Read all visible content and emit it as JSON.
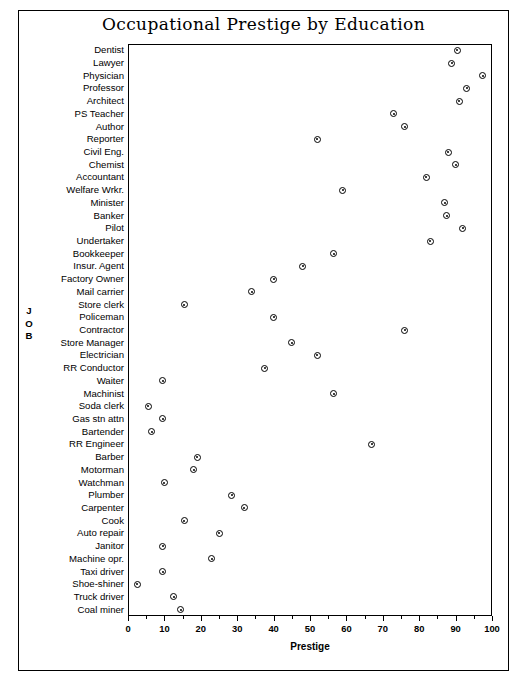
{
  "chart_data": {
    "type": "scatter",
    "title": "Occupational Prestige by Education",
    "xlabel": "Prestige",
    "ylabel": "JOB",
    "xlim": [
      0,
      100
    ],
    "xticks": [
      0,
      10,
      20,
      30,
      40,
      50,
      60,
      70,
      80,
      90,
      100
    ],
    "xticklabels": [
      "0",
      "10",
      "20",
      "30",
      "40",
      "50",
      "60",
      "70",
      "80",
      "90",
      "100"
    ],
    "grid": false,
    "legend": null,
    "marker": "circle-with-center-dot",
    "categories": [
      "Dentist",
      "Lawyer",
      "Physician",
      "Professor",
      "Architect",
      "PS Teacher",
      "Author",
      "Reporter",
      "Civil Eng.",
      "Chemist",
      "Accountant",
      "Welfare Wrkr.",
      "Minister",
      "Banker",
      "Pilot",
      "Undertaker",
      "Bookkeeper",
      "Insur. Agent",
      "Factory Owner",
      "Mail carrier",
      "Store clerk",
      "Policeman",
      "Contractor",
      "Store Manager",
      "Electrician",
      "RR Conductor",
      "Waiter",
      "Machinist",
      "Soda clerk",
      "Gas stn attn",
      "Bartender",
      "RR Engineer",
      "Barber",
      "Motorman",
      "Watchman",
      "Plumber",
      "Carpenter",
      "Cook",
      "Auto repair",
      "Janitor",
      "Machine opr.",
      "Taxi driver",
      "Shoe-shiner",
      "Truck driver",
      "Coal miner"
    ],
    "values": [
      90.5,
      89.0,
      97.5,
      93.0,
      91.0,
      73.0,
      76.0,
      52.0,
      88.0,
      90.0,
      82.0,
      59.0,
      87.0,
      87.5,
      92.0,
      83.0,
      56.5,
      48.0,
      40.0,
      34.0,
      15.5,
      40.0,
      76.0,
      45.0,
      52.0,
      37.5,
      9.5,
      56.5,
      5.5,
      9.5,
      6.5,
      67.0,
      19.0,
      18.0,
      10.0,
      28.5,
      32.0,
      15.5,
      25.0,
      9.5,
      23.0,
      9.5,
      2.5,
      12.5,
      14.5
    ],
    "series": [
      {
        "name": "Prestige",
        "points": [
          {
            "label": "Dentist",
            "value": 90.5
          },
          {
            "label": "Lawyer",
            "value": 89.0
          },
          {
            "label": "Physician",
            "value": 97.5
          },
          {
            "label": "Professor",
            "value": 93.0
          },
          {
            "label": "Architect",
            "value": 91.0
          },
          {
            "label": "PS Teacher",
            "value": 73.0
          },
          {
            "label": "Author",
            "value": 76.0
          },
          {
            "label": "Reporter",
            "value": 52.0
          },
          {
            "label": "Civil Eng.",
            "value": 88.0
          },
          {
            "label": "Chemist",
            "value": 90.0
          },
          {
            "label": "Accountant",
            "value": 82.0
          },
          {
            "label": "Welfare Wrkr.",
            "value": 59.0
          },
          {
            "label": "Minister",
            "value": 87.0
          },
          {
            "label": "Banker",
            "value": 87.5
          },
          {
            "label": "Pilot",
            "value": 92.0
          },
          {
            "label": "Undertaker",
            "value": 83.0
          },
          {
            "label": "Bookkeeper",
            "value": 56.5
          },
          {
            "label": "Insur. Agent",
            "value": 48.0
          },
          {
            "label": "Factory Owner",
            "value": 40.0
          },
          {
            "label": "Mail carrier",
            "value": 34.0
          },
          {
            "label": "Store clerk",
            "value": 15.5
          },
          {
            "label": "Policeman",
            "value": 40.0
          },
          {
            "label": "Contractor",
            "value": 76.0
          },
          {
            "label": "Store Manager",
            "value": 45.0
          },
          {
            "label": "Electrician",
            "value": 52.0
          },
          {
            "label": "RR Conductor",
            "value": 37.5
          },
          {
            "label": "Waiter",
            "value": 9.5
          },
          {
            "label": "Machinist",
            "value": 56.5
          },
          {
            "label": "Soda clerk",
            "value": 5.5
          },
          {
            "label": "Gas stn attn",
            "value": 9.5
          },
          {
            "label": "Bartender",
            "value": 6.5
          },
          {
            "label": "RR Engineer",
            "value": 67.0
          },
          {
            "label": "Barber",
            "value": 19.0
          },
          {
            "label": "Motorman",
            "value": 18.0
          },
          {
            "label": "Watchman",
            "value": 10.0
          },
          {
            "label": "Plumber",
            "value": 28.5
          },
          {
            "label": "Carpenter",
            "value": 32.0
          },
          {
            "label": "Cook",
            "value": 15.5
          },
          {
            "label": "Auto repair",
            "value": 25.0
          },
          {
            "label": "Janitor",
            "value": 9.5
          },
          {
            "label": "Machine opr.",
            "value": 23.0
          },
          {
            "label": "Taxi driver",
            "value": 9.5
          },
          {
            "label": "Shoe-shiner",
            "value": 2.5
          },
          {
            "label": "Truck driver",
            "value": 12.5
          },
          {
            "label": "Coal miner",
            "value": 14.5
          }
        ]
      }
    ]
  }
}
